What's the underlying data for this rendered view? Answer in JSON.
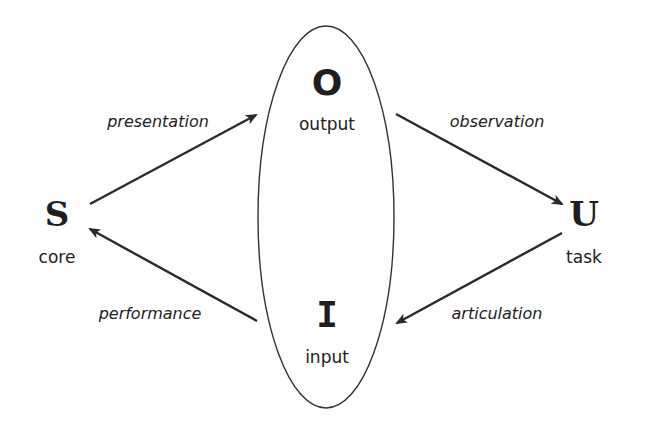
{
  "diagram": {
    "title": "",
    "nodes": {
      "system": {
        "letter": "S",
        "label": "core"
      },
      "output": {
        "letter": "O",
        "label": "output"
      },
      "input": {
        "letter": "I",
        "label": "input"
      },
      "user": {
        "letter": "U",
        "label": "task"
      }
    },
    "interface_region": {
      "shape": "ellipse",
      "contains": [
        "output",
        "input"
      ]
    },
    "edges": [
      {
        "from": "S",
        "to": "O",
        "label": "presentation"
      },
      {
        "from": "O",
        "to": "U",
        "label": "observation"
      },
      {
        "from": "U",
        "to": "I",
        "label": "articulation"
      },
      {
        "from": "I",
        "to": "S",
        "label": "performance"
      }
    ],
    "colors": {
      "stroke": "#2a2a2a",
      "background": "#ffffff"
    }
  }
}
